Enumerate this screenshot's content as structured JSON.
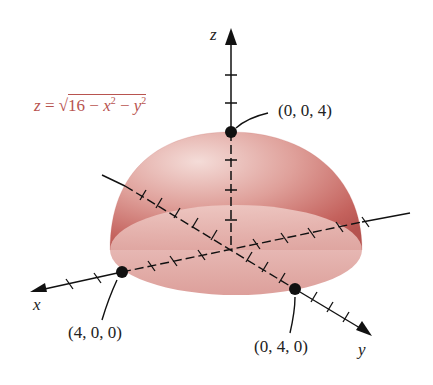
{
  "figure": {
    "type": "3d-surface-diagram",
    "surface": "upper hemisphere",
    "equation": {
      "lhs": "z",
      "equals": "=",
      "sqrt_symbol": "√",
      "radicand_const": "16",
      "minus": "−",
      "term1_var": "x",
      "term2_var": "y",
      "exponent": "2",
      "full_text": "z = √(16 − x² − y²)"
    },
    "axes": {
      "x_label": "x",
      "y_label": "y",
      "z_label": "z"
    },
    "points": [
      {
        "label": "(0, 0, 4)",
        "description": "top of hemisphere"
      },
      {
        "label": "(4, 0, 0)",
        "description": "x-intercept"
      },
      {
        "label": "(0, 4, 0)",
        "description": "y-intercept"
      }
    ],
    "colors": {
      "surface": "#c9706c",
      "surface_light": "#f1d3cf",
      "equation_text": "#b8544f",
      "axis": "#111111",
      "label_text": "#222222"
    }
  }
}
